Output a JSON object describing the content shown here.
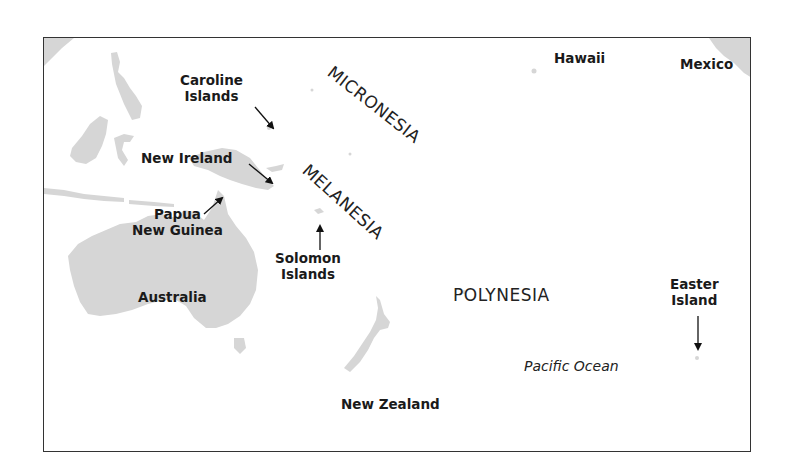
{
  "map": {
    "colors": {
      "land": "#d4d4d4",
      "border": "#333333",
      "text": "#1a1a1a",
      "background": "#ffffff"
    },
    "labels": {
      "caroline_islands": [
        "Caroline",
        "Islands"
      ],
      "new_ireland": "New Ireland",
      "papua_new_guinea": [
        "Papua",
        "New Guinea"
      ],
      "solomon_islands": [
        "Solomon",
        "Islands"
      ],
      "australia": "Australia",
      "new_zealand": "New Zealand",
      "hawaii": "Hawaii",
      "mexico": "Mexico",
      "easter_island": [
        "Easter",
        "Island"
      ]
    },
    "regions": {
      "micronesia": "MICRONESIA",
      "melanesia": "MELANESIA",
      "polynesia": "POLYNESIA"
    },
    "ocean": "Pacific Ocean"
  }
}
